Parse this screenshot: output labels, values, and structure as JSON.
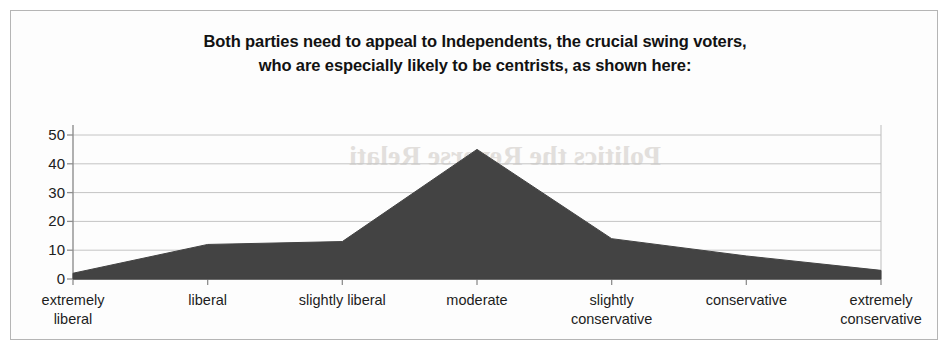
{
  "figure": {
    "border_color": "#b5b5b5",
    "background": "#fdfdfd"
  },
  "title": {
    "line1": "Both parties need to appeal to Independents, the crucial swing voters,",
    "line2": "who are especially likely to be centrists, as shown here:"
  },
  "axis": {
    "y_ticks": [
      "50",
      "40",
      "30",
      "20",
      "10",
      "0"
    ]
  },
  "chart_data": {
    "type": "area",
    "title": "Both parties need to appeal to Independents, the crucial swing voters, who are especially likely to be centrists, as shown here:",
    "xlabel": "",
    "ylabel": "",
    "ylim": [
      0,
      50
    ],
    "yticks": [
      0,
      10,
      20,
      30,
      40,
      50
    ],
    "grid": true,
    "legend": false,
    "fill_color": "#434343",
    "categories": [
      "extremely liberal",
      "liberal",
      "slightly liberal",
      "moderate",
      "slightly conservative",
      "conservative",
      "extremely conservative"
    ],
    "category_lines": [
      [
        "extremely",
        "liberal"
      ],
      [
        "liberal",
        ""
      ],
      [
        "slightly liberal",
        ""
      ],
      [
        "moderate",
        ""
      ],
      [
        "slightly",
        "conservative"
      ],
      [
        "conservative",
        ""
      ],
      [
        "extremely",
        "conservative"
      ]
    ],
    "values": [
      2,
      12,
      13,
      45,
      14,
      8,
      3
    ]
  }
}
